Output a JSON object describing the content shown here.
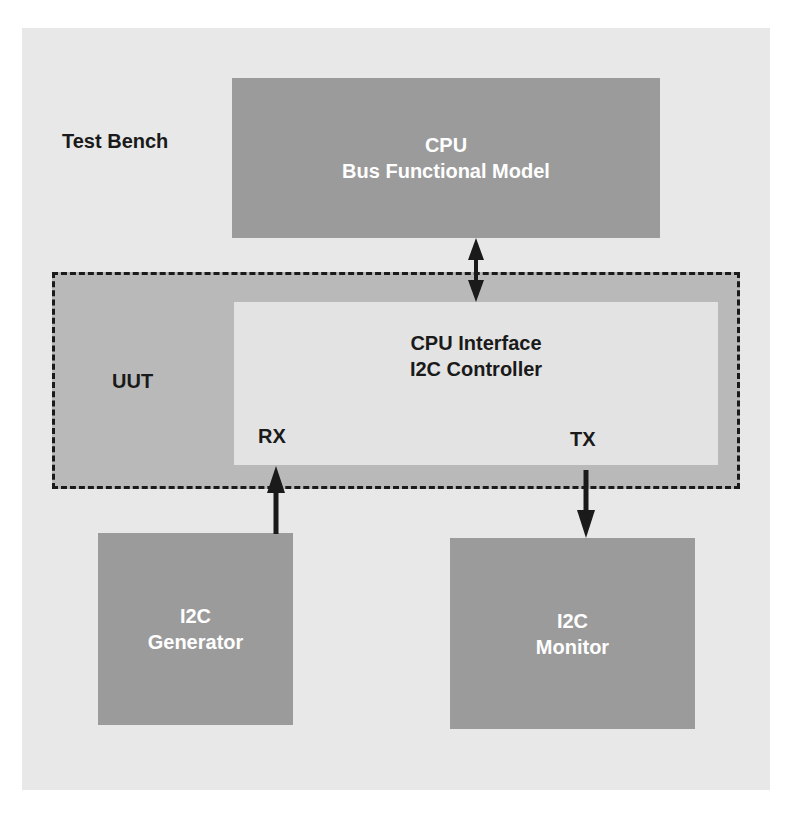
{
  "diagram": {
    "title_label": "Test Bench",
    "cpu_bfm": {
      "line1": "CPU",
      "line2": "Bus Functional Model"
    },
    "uut": {
      "label": "UUT",
      "controller": {
        "line1": "CPU Interface",
        "line2": "I2C Controller"
      },
      "rx_label": "RX",
      "tx_label": "TX"
    },
    "generator": {
      "line1": "I2C",
      "line2": "Generator"
    },
    "monitor": {
      "line1": "I2C",
      "line2": "Monitor"
    },
    "connections": [
      {
        "from": "CPU Bus Functional Model",
        "to": "CPU Interface I2C Controller",
        "direction": "bidirectional"
      },
      {
        "from": "I2C Generator",
        "to": "RX",
        "direction": "up"
      },
      {
        "from": "TX",
        "to": "I2C Monitor",
        "direction": "down"
      }
    ],
    "colors": {
      "background_panel": "#e8e8e8",
      "module_box": "#9b9b9b",
      "uut_fill": "#b9b9b9",
      "controller_fill": "#e3e3e3",
      "text_dark": "#1a1a1a",
      "text_light": "#ffffff"
    }
  }
}
